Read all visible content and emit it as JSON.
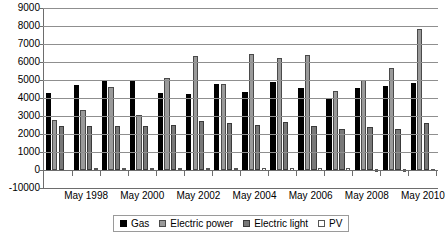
{
  "chart_data": {
    "type": "bar",
    "title": "",
    "xlabel": "",
    "ylabel": "",
    "ylim": [
      -10000,
      9000
    ],
    "yticks": [
      9000,
      8000,
      7000,
      6000,
      5000,
      4000,
      3000,
      2000,
      1000,
      0,
      -10000
    ],
    "ytick_labels": [
      "9000",
      "8000",
      "7000",
      "6000",
      "5000",
      "4000",
      "3000",
      "2000",
      "1000",
      "0",
      "-10000"
    ],
    "grid": true,
    "legend_position": "bottom",
    "categories": [
      "May 1997",
      "May 1998",
      "May 1999",
      "May 2000",
      "May 2001",
      "May 2002",
      "May 2003",
      "May 2004",
      "May 2005",
      "May 2006",
      "May 2007",
      "May 2008",
      "May 2009",
      "May 2010"
    ],
    "xtick_labels": [
      "May 1998",
      "May 2000",
      "May 2002",
      "May 2004",
      "May 2006",
      "May 2008",
      "May 2010"
    ],
    "xtick_categories": [
      "May 1998",
      "May 2000",
      "May 2002",
      "May 2004",
      "May 2006",
      "May 2008",
      "May 2010"
    ],
    "series": [
      {
        "name": "Gas",
        "color": "#000000",
        "values": [
          4280,
          0,
          4700,
          0,
          4980,
          0,
          4920,
          0,
          4280,
          0,
          4220,
          0,
          4800,
          0
        ]
      },
      {
        "name": "Electric power",
        "color": "#9a9a9a",
        "values": [
          2780,
          3320,
          0,
          3030,
          0,
          2710,
          0,
          2600,
          0,
          2520,
          0,
          2420,
          0,
          2280
        ]
      },
      {
        "name": "Electric light",
        "color": "#787878",
        "values": [
          2450,
          2430,
          4600,
          0,
          5120,
          6320,
          4780,
          6420,
          6250,
          6400,
          4380,
          5010,
          5650,
          7820
        ]
      },
      {
        "name": "PV",
        "color": "#ffffff",
        "values": [
          0,
          -110,
          -150,
          -160,
          -260,
          -130,
          -220,
          -300,
          -320,
          -420,
          -480,
          -900,
          -850,
          -800
        ]
      }
    ],
    "groups": [
      {
        "label": "May 1997",
        "bars": [
          {
            "series": "Gas",
            "value": 4280
          },
          {
            "series": "Electric power",
            "value": 2780
          },
          {
            "series": "Electric light",
            "value": 2450
          },
          {
            "series": "PV",
            "value": 0
          }
        ]
      },
      {
        "label": "May 1998",
        "bars": [
          {
            "series": "Gas",
            "value": 4700
          },
          {
            "series": "Electric power",
            "value": 3320
          },
          {
            "series": "Electric light",
            "value": 2430
          },
          {
            "series": "PV",
            "value": -110
          }
        ]
      },
      {
        "label": "May 1999",
        "bars": [
          {
            "series": "Gas",
            "value": 4980
          },
          {
            "series": "Electric power",
            "value": 4600
          },
          {
            "series": "Electric light",
            "value": 2430
          },
          {
            "series": "PV",
            "value": -150
          }
        ]
      },
      {
        "label": "May 2000",
        "bars": [
          {
            "series": "Gas",
            "value": 4920
          },
          {
            "series": "Electric power",
            "value": 3030
          },
          {
            "series": "Electric light",
            "value": 2450
          },
          {
            "series": "PV",
            "value": -160
          }
        ]
      },
      {
        "label": "May 2001",
        "bars": [
          {
            "series": "Gas",
            "value": 4280
          },
          {
            "series": "Electric power",
            "value": 5120
          },
          {
            "series": "Electric light",
            "value": 2480
          },
          {
            "series": "PV",
            "value": -260
          }
        ]
      },
      {
        "label": "May 2002",
        "bars": [
          {
            "series": "Gas",
            "value": 4220
          },
          {
            "series": "Electric power",
            "value": 6320
          },
          {
            "series": "Electric light",
            "value": 2710
          },
          {
            "series": "PV",
            "value": -130
          }
        ]
      },
      {
        "label": "May 2003",
        "bars": [
          {
            "series": "Gas",
            "value": 4800
          },
          {
            "series": "Electric power",
            "value": 4780
          },
          {
            "series": "Electric light",
            "value": 2600
          },
          {
            "series": "PV",
            "value": -220
          }
        ]
      },
      {
        "label": "May 2004",
        "bars": [
          {
            "series": "Gas",
            "value": 4360
          },
          {
            "series": "Electric power",
            "value": 6420
          },
          {
            "series": "Electric light",
            "value": 2520
          },
          {
            "series": "PV",
            "value": -300
          }
        ]
      },
      {
        "label": "May 2005",
        "bars": [
          {
            "series": "Gas",
            "value": 4900
          },
          {
            "series": "Electric power",
            "value": 6250
          },
          {
            "series": "Electric light",
            "value": 2680
          },
          {
            "series": "PV",
            "value": -320
          }
        ]
      },
      {
        "label": "May 2006",
        "bars": [
          {
            "series": "Gas",
            "value": 4560
          },
          {
            "series": "Electric power",
            "value": 6400
          },
          {
            "series": "Electric light",
            "value": 2420
          },
          {
            "series": "PV",
            "value": -420
          }
        ]
      },
      {
        "label": "May 2007",
        "bars": [
          {
            "series": "Gas",
            "value": 3980
          },
          {
            "series": "Electric power",
            "value": 4380
          },
          {
            "series": "Electric light",
            "value": 2280
          },
          {
            "series": "PV",
            "value": -480
          }
        ]
      },
      {
        "label": "May 2008",
        "bars": [
          {
            "series": "Gas",
            "value": 4580
          },
          {
            "series": "Electric power",
            "value": 5010
          },
          {
            "series": "Electric light",
            "value": 2380
          },
          {
            "series": "PV",
            "value": -900
          }
        ]
      },
      {
        "label": "May 2009",
        "bars": [
          {
            "series": "Gas",
            "value": 4650
          },
          {
            "series": "Electric power",
            "value": 5650
          },
          {
            "series": "Electric light",
            "value": 2300
          },
          {
            "series": "PV",
            "value": -850
          }
        ]
      },
      {
        "label": "May 2010",
        "bars": [
          {
            "series": "Gas",
            "value": 4830
          },
          {
            "series": "Electric power",
            "value": 7820
          },
          {
            "series": "Electric light",
            "value": 2600
          },
          {
            "series": "PV",
            "value": -800
          }
        ]
      }
    ]
  },
  "legend": {
    "items": [
      {
        "label": "Gas",
        "key": "gas"
      },
      {
        "label": "Electric power",
        "key": "epower"
      },
      {
        "label": "Electric light",
        "key": "elight"
      },
      {
        "label": "PV",
        "key": "pv"
      }
    ]
  }
}
